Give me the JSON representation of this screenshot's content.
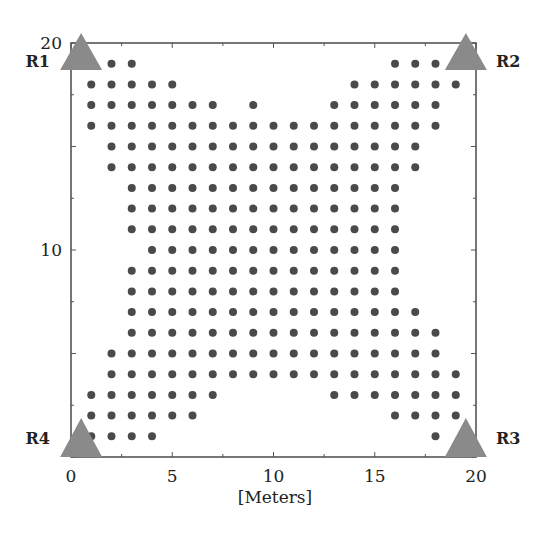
{
  "chart_data": {
    "type": "scatter",
    "title": "",
    "xlabel": "[Meters]",
    "ylabel": "",
    "xlim": [
      0,
      20
    ],
    "ylim": [
      0,
      20
    ],
    "x_ticks": [
      0,
      5,
      10,
      15,
      20
    ],
    "x_tick_labels": [
      "0",
      "5",
      "10",
      "15",
      "20"
    ],
    "y_ticks": [
      10,
      20
    ],
    "y_tick_labels": [
      "10",
      "20"
    ],
    "grid": false,
    "legend": null,
    "colors": {
      "dot": "#4a4a4a",
      "receiver": "#8a8a8a",
      "axis": "#555555"
    },
    "receivers": [
      {
        "name": "R1",
        "x": 0.5,
        "y": 20,
        "label_side": "left"
      },
      {
        "name": "R2",
        "x": 19.5,
        "y": 20,
        "label_side": "right"
      },
      {
        "name": "R3",
        "x": 19.5,
        "y": 0,
        "label_side": "right"
      },
      {
        "name": "R4",
        "x": 0.5,
        "y": 0,
        "label_side": "left"
      }
    ],
    "grid_points_by_row": [
      {
        "y": 19,
        "x": [
          2,
          3,
          16,
          17,
          18
        ]
      },
      {
        "y": 18,
        "x": [
          1,
          2,
          3,
          4,
          5,
          14,
          15,
          16,
          17,
          18,
          19
        ]
      },
      {
        "y": 17,
        "x": [
          1,
          2,
          3,
          4,
          5,
          6,
          7,
          9,
          13,
          14,
          15,
          16,
          17,
          18
        ]
      },
      {
        "y": 16,
        "x": [
          1,
          2,
          3,
          4,
          5,
          6,
          7,
          8,
          9,
          10,
          11,
          12,
          13,
          14,
          15,
          16,
          17,
          18
        ]
      },
      {
        "y": 15,
        "x": [
          2,
          3,
          4,
          5,
          6,
          7,
          8,
          9,
          10,
          11,
          12,
          13,
          14,
          15,
          16,
          17
        ]
      },
      {
        "y": 14,
        "x": [
          2,
          3,
          4,
          5,
          6,
          7,
          8,
          9,
          10,
          11,
          12,
          13,
          14,
          15,
          16,
          17
        ]
      },
      {
        "y": 13,
        "x": [
          3,
          4,
          5,
          6,
          7,
          8,
          9,
          10,
          11,
          12,
          13,
          14,
          15,
          16
        ]
      },
      {
        "y": 12,
        "x": [
          3,
          4,
          5,
          6,
          7,
          8,
          9,
          10,
          11,
          12,
          13,
          14,
          15,
          16
        ]
      },
      {
        "y": 11,
        "x": [
          3,
          4,
          5,
          6,
          7,
          8,
          9,
          10,
          11,
          12,
          13,
          14,
          15,
          16
        ]
      },
      {
        "y": 10,
        "x": [
          4,
          5,
          6,
          7,
          8,
          9,
          10,
          11,
          12,
          13,
          14,
          15,
          16
        ]
      },
      {
        "y": 9,
        "x": [
          3,
          4,
          5,
          6,
          7,
          8,
          9,
          10,
          11,
          12,
          13,
          14,
          15,
          16
        ]
      },
      {
        "y": 8,
        "x": [
          3,
          4,
          5,
          6,
          7,
          8,
          9,
          10,
          11,
          12,
          13,
          14,
          15,
          16
        ]
      },
      {
        "y": 7,
        "x": [
          3,
          4,
          5,
          6,
          7,
          8,
          9,
          10,
          11,
          12,
          13,
          14,
          15,
          16,
          17
        ]
      },
      {
        "y": 6,
        "x": [
          3,
          4,
          5,
          6,
          7,
          8,
          9,
          10,
          11,
          12,
          13,
          14,
          15,
          16,
          17,
          18
        ]
      },
      {
        "y": 5,
        "x": [
          2,
          3,
          4,
          5,
          6,
          7,
          8,
          9,
          10,
          11,
          12,
          13,
          14,
          15,
          16,
          17,
          18
        ]
      },
      {
        "y": 4,
        "x": [
          2,
          3,
          4,
          5,
          6,
          7,
          8,
          9,
          10,
          11,
          12,
          13,
          14,
          15,
          16,
          17,
          18,
          19
        ]
      },
      {
        "y": 3,
        "x": [
          1,
          2,
          3,
          4,
          5,
          6,
          7,
          13,
          14,
          15,
          16,
          17,
          18,
          19
        ]
      },
      {
        "y": 2,
        "x": [
          1,
          2,
          3,
          4,
          5,
          6,
          16,
          17,
          18,
          19
        ]
      },
      {
        "y": 1,
        "x": [
          1,
          2,
          3,
          4,
          18
        ]
      }
    ]
  }
}
